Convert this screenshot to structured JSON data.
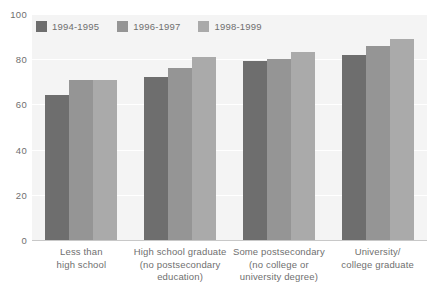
{
  "chart_data": {
    "type": "bar",
    "title": "",
    "subtitle": "",
    "xlabel": "",
    "ylabel": "",
    "ylim": [
      0,
      100
    ],
    "yticks": [
      0,
      20,
      40,
      60,
      80,
      100
    ],
    "grid": true,
    "legend_position": "top-left",
    "categories": [
      "Less than\nhigh school",
      "High school graduate\n(no postsecondary\neducation)",
      "Some postsecondary\n(no college or\nuniversity degree)",
      "University/\ncollege graduate"
    ],
    "category_lines": [
      [
        "Less than",
        "high school"
      ],
      [
        "High school graduate",
        "(no postsecondary",
        "education)"
      ],
      [
        "Some postsecondary",
        "(no college or",
        "university degree)"
      ],
      [
        "University/",
        "college graduate"
      ]
    ],
    "series": [
      {
        "name": "1994-1995",
        "color": "#6e6e6e",
        "values": [
          64,
          72,
          79,
          82
        ]
      },
      {
        "name": "1996-1997",
        "color": "#959595",
        "values": [
          71,
          76,
          80,
          86
        ]
      },
      {
        "name": "1998-1999",
        "color": "#aaaaaa",
        "values": [
          71,
          81,
          83,
          89
        ]
      }
    ]
  },
  "legend": {
    "items": [
      {
        "label": "1994-1995",
        "color": "#6e6e6e"
      },
      {
        "label": "1996-1997",
        "color": "#959595"
      },
      {
        "label": "1998-1999",
        "color": "#aaaaaa"
      }
    ]
  },
  "axis": {
    "y_ticks": [
      "100",
      "80",
      "60",
      "40",
      "20",
      "0"
    ]
  },
  "colors": {
    "plot_background": "#f4f4f4",
    "gridline": "#ffffff",
    "text": "#6f6f6f",
    "series_1": "#6e6e6e",
    "series_2": "#959595",
    "series_3": "#aaaaaa"
  }
}
